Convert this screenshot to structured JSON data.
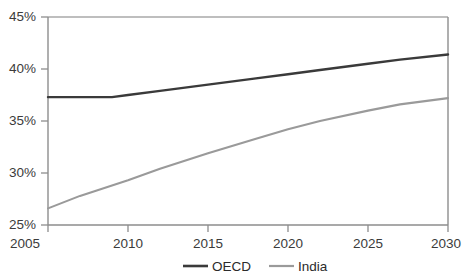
{
  "chart_data": {
    "type": "line",
    "title": "",
    "xlabel": "",
    "ylabel": "",
    "x": [
      2005,
      2010,
      2015,
      2020,
      2025,
      2030
    ],
    "xlim": [
      2005,
      2030
    ],
    "ylim": [
      25,
      45
    ],
    "ytick_labels": [
      "25%",
      "30%",
      "35%",
      "40%",
      "45%"
    ],
    "ytick_values": [
      25,
      30,
      35,
      40,
      45
    ],
    "xtick_labels": [
      "2005",
      "2010",
      "2015",
      "2020",
      "2025",
      "2030"
    ],
    "xtick_values": [
      2005,
      2010,
      2015,
      2020,
      2025,
      2030
    ],
    "grid": false,
    "legend_position": "bottom-center",
    "series": [
      {
        "name": "OECD",
        "color": "#3a3a3a",
        "x": [
          2005,
          2006,
          2007,
          2008,
          2009,
          2010,
          2012,
          2015,
          2018,
          2020,
          2022,
          2025,
          2027,
          2030
        ],
        "values": [
          37.3,
          37.3,
          37.3,
          37.3,
          37.3,
          37.5,
          37.9,
          38.5,
          39.1,
          39.5,
          39.9,
          40.5,
          40.9,
          41.4
        ]
      },
      {
        "name": "India",
        "color": "#9a9a9a",
        "x": [
          2005,
          2006,
          2007,
          2008,
          2009,
          2010,
          2012,
          2015,
          2018,
          2020,
          2022,
          2025,
          2027,
          2030
        ],
        "values": [
          26.6,
          27.2,
          27.8,
          28.3,
          28.8,
          29.3,
          30.4,
          31.9,
          33.3,
          34.2,
          35.0,
          36.0,
          36.6,
          37.2
        ]
      }
    ]
  },
  "axes": {
    "y_ticks": [
      {
        "label": "45%",
        "value": 45
      },
      {
        "label": "40%",
        "value": 40
      },
      {
        "label": "35%",
        "value": 35
      },
      {
        "label": "30%",
        "value": 30
      },
      {
        "label": "25%",
        "value": 25
      }
    ],
    "x_ticks": [
      {
        "label": "2005",
        "value": 2005
      },
      {
        "label": "2010",
        "value": 2010
      },
      {
        "label": "2015",
        "value": 2015
      },
      {
        "label": "2020",
        "value": 2020
      },
      {
        "label": "2025",
        "value": 2025
      },
      {
        "label": "2030",
        "value": 2030
      }
    ]
  },
  "legend": {
    "entries": [
      {
        "label": "OECD",
        "color": "#3a3a3a"
      },
      {
        "label": "India",
        "color": "#9a9a9a"
      }
    ]
  },
  "colors": {
    "oecd_line": "#3a3a3a",
    "india_line": "#9a9a9a",
    "axis": "#8d8d8d",
    "tick_text": "#3b3b3b"
  }
}
